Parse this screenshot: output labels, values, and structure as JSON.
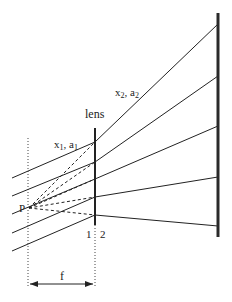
{
  "diagram": {
    "labels": {
      "lens": "lens",
      "region1": {
        "x": "x",
        "x_sub": "1",
        "sep": ", ",
        "a": "a",
        "a_sub": "1"
      },
      "region2": {
        "x": "x",
        "x_sub": "2",
        "sep": ", ",
        "a": "a",
        "a_sub": "2"
      },
      "point": "P",
      "plane1": "1",
      "plane2": "2",
      "focal_length": "f"
    },
    "colors": {
      "stroke": "#222222",
      "screen": "#2a2a2a",
      "background": "#ffffff"
    },
    "geometry": {
      "lens_x": 95,
      "screen_x": 218,
      "focal_plane_x": 28,
      "point_P": [
        29,
        208
      ],
      "incoming_rays": [
        {
          "start": [
            12,
            178
          ],
          "lens_hit": [
            95,
            142
          ],
          "screen_hit": [
            218,
            24
          ]
        },
        {
          "start": [
            12,
            196
          ],
          "lens_hit": [
            95,
            162
          ],
          "screen_hit": [
            218,
            76
          ]
        },
        {
          "start": [
            12,
            214
          ],
          "lens_hit": [
            95,
            179
          ],
          "screen_hit": [
            218,
            126
          ]
        },
        {
          "start": [
            12,
            233
          ],
          "lens_hit": [
            95,
            197
          ],
          "screen_hit": [
            218,
            177
          ]
        },
        {
          "start": [
            12,
            251
          ],
          "lens_hit": [
            95,
            215
          ],
          "screen_hit": [
            218,
            226
          ]
        }
      ]
    }
  }
}
